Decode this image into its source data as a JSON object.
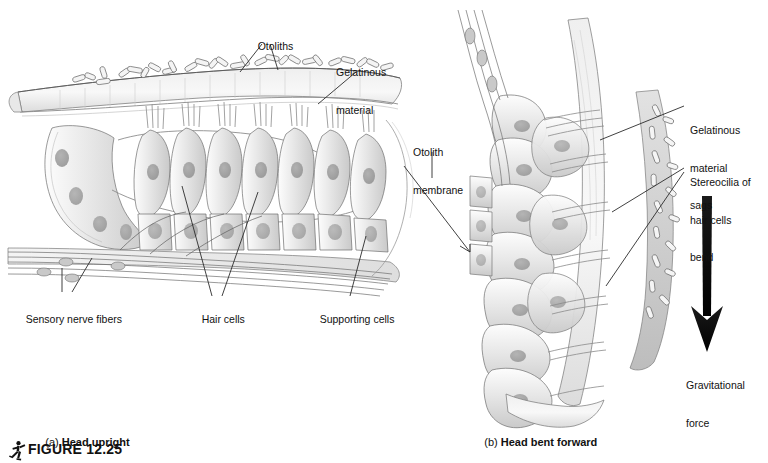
{
  "figure": {
    "number_label": "FIGURE 12.25",
    "icon": "running-figure-icon"
  },
  "panels": [
    {
      "id": "a",
      "prefix": "(a)",
      "caption": "Head upright",
      "labels": [
        {
          "name": "otoliths",
          "lines": [
            "Otoliths"
          ]
        },
        {
          "name": "gelatinous-material",
          "lines": [
            "Gelatinous",
            "material"
          ]
        },
        {
          "name": "otolith-membrane",
          "lines": [
            "Otolith",
            "membrane"
          ]
        },
        {
          "name": "sensory-nerve-fibers",
          "lines": [
            "Sensory nerve fibers"
          ]
        },
        {
          "name": "hair-cells",
          "lines": [
            "Hair cells"
          ]
        },
        {
          "name": "supporting-cells",
          "lines": [
            "Supporting cells"
          ]
        }
      ]
    },
    {
      "id": "b",
      "prefix": "(b)",
      "caption": "Head bent forward",
      "labels": [
        {
          "name": "gelatinous-material-sags",
          "lines": [
            "Gelatinous",
            "material",
            "sags"
          ]
        },
        {
          "name": "stereocilia-of-hair-cells-bend",
          "lines": [
            "Stereocilia of",
            "hair cells",
            "bend"
          ]
        },
        {
          "name": "gravitational-force",
          "lines": [
            "Gravitational",
            "force"
          ]
        }
      ]
    }
  ],
  "colors": {
    "background": "#ffffff",
    "ink": "#111111",
    "leader_line": "#2b2b2b",
    "arrow": "#111111",
    "wash_light": "#f0f0f0",
    "wash_mid": "#d8d8d8",
    "wash_dark": "#b4b4b4",
    "nucleus": "#9a9a9a"
  }
}
